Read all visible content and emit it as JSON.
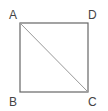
{
  "diagram": {
    "type": "square-with-diagonal",
    "vertices": [
      {
        "label": "A",
        "x": 20,
        "y": 23
      },
      {
        "label": "B",
        "x": 20,
        "y": 92
      },
      {
        "label": "C",
        "x": 88,
        "y": 92
      },
      {
        "label": "D",
        "x": 88,
        "y": 23
      }
    ],
    "diagonal": [
      "A",
      "C"
    ],
    "colors": {
      "edge": "#666666",
      "diagonal": "#999999",
      "label": "#444444"
    }
  }
}
